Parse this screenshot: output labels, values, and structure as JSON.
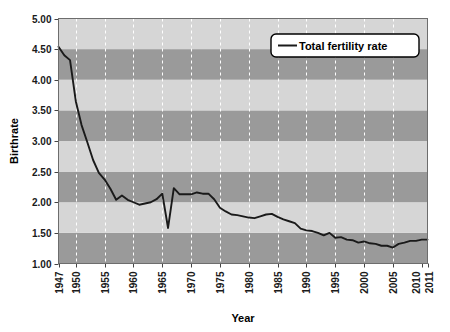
{
  "chart_data": {
    "type": "line",
    "title": "",
    "xlabel": "Year",
    "ylabel": "Birthrate",
    "xlim": [
      1947,
      2011
    ],
    "ylim": [
      1.0,
      5.0
    ],
    "grid": true,
    "legend_position": "top-right",
    "y_ticks": [
      "1.00",
      "1.50",
      "2.00",
      "2.50",
      "3.00",
      "3.50",
      "4.00",
      "4.50",
      "5.00"
    ],
    "y_tick_values": [
      1.0,
      1.5,
      2.0,
      2.5,
      3.0,
      3.5,
      4.0,
      4.5,
      5.0
    ],
    "x_ticks": [
      "1947",
      "1950",
      "1955",
      "1960",
      "1965",
      "1970",
      "1975",
      "1980",
      "1985",
      "1990",
      "1995",
      "2000",
      "2005",
      "2010",
      "2011"
    ],
    "x_tick_values": [
      1947,
      1950,
      1955,
      1960,
      1965,
      1970,
      1975,
      1980,
      1985,
      1990,
      1995,
      2000,
      2005,
      2010,
      2011
    ],
    "series": [
      {
        "name": "Total fertility rate",
        "color": "#1a1a1a",
        "x": [
          1947,
          1948,
          1949,
          1950,
          1951,
          1952,
          1953,
          1954,
          1955,
          1956,
          1957,
          1958,
          1959,
          1960,
          1961,
          1962,
          1963,
          1964,
          1965,
          1966,
          1967,
          1968,
          1969,
          1970,
          1971,
          1972,
          1973,
          1974,
          1975,
          1976,
          1977,
          1978,
          1979,
          1980,
          1981,
          1982,
          1983,
          1984,
          1985,
          1986,
          1987,
          1988,
          1989,
          1990,
          1991,
          1992,
          1993,
          1994,
          1995,
          1996,
          1997,
          1998,
          1999,
          2000,
          2001,
          2002,
          2003,
          2004,
          2005,
          2006,
          2007,
          2008,
          2009,
          2010,
          2011
        ],
        "values": [
          4.54,
          4.4,
          4.32,
          3.65,
          3.26,
          2.98,
          2.69,
          2.48,
          2.37,
          2.22,
          2.04,
          2.11,
          2.04,
          2.0,
          1.96,
          1.98,
          2.0,
          2.05,
          2.14,
          1.58,
          2.23,
          2.13,
          2.13,
          2.13,
          2.16,
          2.14,
          2.14,
          2.05,
          1.91,
          1.85,
          1.8,
          1.79,
          1.77,
          1.75,
          1.74,
          1.77,
          1.8,
          1.81,
          1.76,
          1.72,
          1.69,
          1.66,
          1.57,
          1.54,
          1.53,
          1.5,
          1.46,
          1.5,
          1.42,
          1.43,
          1.39,
          1.38,
          1.34,
          1.36,
          1.33,
          1.32,
          1.29,
          1.29,
          1.26,
          1.32,
          1.34,
          1.37,
          1.37,
          1.39,
          1.39
        ]
      }
    ],
    "bands": {
      "light_color": "#d6d6d6",
      "dark_color": "#9a9a9a",
      "interval": 0.5
    },
    "gridline_color": "#ffffff",
    "gridline_style": "dashed",
    "plot_border_color": "#6d6d6d"
  },
  "legend": {
    "entries": [
      {
        "label": "Total fertility rate"
      }
    ]
  },
  "axes": {
    "y_title": "Birthrate",
    "x_title": "Year"
  }
}
